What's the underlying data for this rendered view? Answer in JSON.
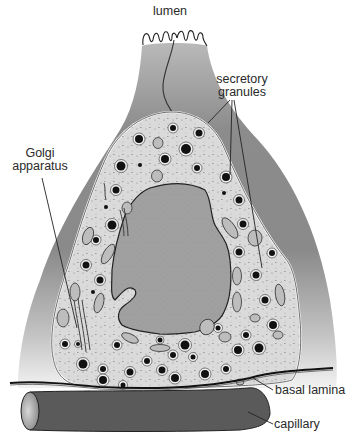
{
  "figure": {
    "colors": {
      "background": "#ffffff",
      "cell_body": "#8a8a8a",
      "cytoplasm": "#d9d9d9",
      "nucleus": "#9c9c9c",
      "granule": "#111111",
      "capillary": "#555555",
      "outline": "#222222"
    }
  },
  "labels": {
    "lumen": "lumen",
    "secretory_granules_line1": "secretory",
    "secretory_granules_line2": "granules",
    "golgi_line1": "Golgi",
    "golgi_line2": "apparatus",
    "basal_lamina": "basal lamina",
    "capillary": "capillary"
  }
}
